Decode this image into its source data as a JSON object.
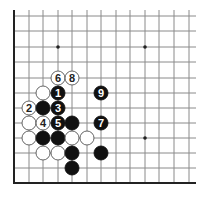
{
  "diagram": {
    "type": "go-board-corner",
    "colors": {
      "background": "#ffffff",
      "grid_line": "#8a8a8a",
      "edge_line": "#222222",
      "black_stone": "#111111",
      "white_stone": "#ffffff",
      "white_stone_outline": "#555555",
      "black_label": "#ffffff",
      "white_label": "#222222"
    },
    "grid": {
      "columns_x": [
        14,
        29,
        43,
        58,
        72,
        87,
        101,
        116,
        130,
        145,
        159,
        174,
        189
      ],
      "rows_y": [
        16,
        31,
        47,
        62,
        78,
        93,
        108,
        123,
        138,
        153,
        168,
        183
      ],
      "top_extent": 10,
      "right_extent": 196,
      "left_edge_col": 0,
      "bottom_edge_row": 11
    },
    "star_points": [
      {
        "col": 3,
        "row": 2
      },
      {
        "col": 9,
        "row": 2
      },
      {
        "col": 9,
        "row": 8
      }
    ],
    "stones": [
      {
        "col": 3,
        "row": 4,
        "color": "white",
        "label": "6"
      },
      {
        "col": 4,
        "row": 4,
        "color": "white",
        "label": "8"
      },
      {
        "col": 2,
        "row": 5,
        "color": "white",
        "label": ""
      },
      {
        "col": 3,
        "row": 5,
        "color": "black",
        "label": "1"
      },
      {
        "col": 6,
        "row": 5,
        "color": "black",
        "label": "9"
      },
      {
        "col": 1,
        "row": 6,
        "color": "white",
        "label": "2"
      },
      {
        "col": 2,
        "row": 6,
        "color": "black",
        "label": ""
      },
      {
        "col": 3,
        "row": 6,
        "color": "black",
        "label": "3"
      },
      {
        "col": 1,
        "row": 7,
        "color": "white",
        "label": ""
      },
      {
        "col": 2,
        "row": 7,
        "color": "white",
        "label": "4"
      },
      {
        "col": 3,
        "row": 7,
        "color": "black",
        "label": "5"
      },
      {
        "col": 4,
        "row": 7,
        "color": "black",
        "label": ""
      },
      {
        "col": 6,
        "row": 7,
        "color": "black",
        "label": "7"
      },
      {
        "col": 1,
        "row": 8,
        "color": "white",
        "label": ""
      },
      {
        "col": 2,
        "row": 8,
        "color": "black",
        "label": ""
      },
      {
        "col": 3,
        "row": 8,
        "color": "black",
        "label": ""
      },
      {
        "col": 4,
        "row": 8,
        "color": "white",
        "label": ""
      },
      {
        "col": 5,
        "row": 8,
        "color": "white",
        "label": ""
      },
      {
        "col": 2,
        "row": 9,
        "color": "white",
        "label": ""
      },
      {
        "col": 3,
        "row": 9,
        "color": "white",
        "label": ""
      },
      {
        "col": 4,
        "row": 9,
        "color": "black",
        "label": ""
      },
      {
        "col": 6,
        "row": 9,
        "color": "black",
        "label": ""
      },
      {
        "col": 4,
        "row": 10,
        "color": "black",
        "label": ""
      }
    ],
    "stone_radius": 7
  }
}
